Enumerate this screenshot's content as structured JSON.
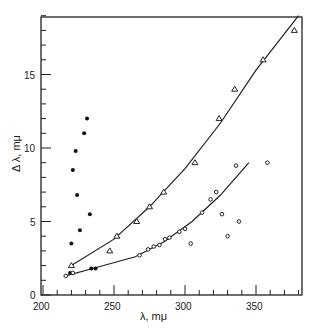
{
  "chart_data": {
    "type": "scatter",
    "title": "",
    "xlabel": "λ, mμ",
    "ylabel": "Δ λ, mμ",
    "xlim": [
      200,
      382
    ],
    "ylim": [
      0,
      19.5
    ],
    "xticks": [
      "200",
      "250",
      "300",
      "350"
    ],
    "yticks": [
      "0",
      "5",
      "10",
      "15"
    ],
    "grid": false,
    "series": [
      {
        "name": "filled-dots",
        "marker": "filled-circle",
        "x": [
          219,
          220,
          221,
          223,
          224,
          226,
          229,
          231,
          233,
          234,
          237
        ],
        "y": [
          1.5,
          3.5,
          8.5,
          9.8,
          6.8,
          4.4,
          11.0,
          12.0,
          5.5,
          1.8,
          1.8
        ]
      },
      {
        "name": "triangles",
        "marker": "triangle",
        "x": [
          220,
          247,
          252,
          266,
          275,
          285,
          307,
          324,
          335,
          355,
          377
        ],
        "y": [
          2.0,
          3.0,
          4.0,
          5.0,
          6.0,
          7.0,
          9.0,
          12.0,
          14.0,
          16.0,
          18.0
        ]
      },
      {
        "name": "open-circles",
        "marker": "open-circle",
        "x": [
          216,
          221,
          268,
          274,
          278,
          282,
          286,
          289,
          296,
          300,
          304,
          312,
          318,
          322,
          326,
          330,
          336,
          338,
          358
        ],
        "y": [
          1.3,
          1.5,
          2.7,
          3.1,
          3.3,
          3.4,
          3.8,
          3.9,
          4.3,
          4.5,
          3.5,
          5.6,
          6.5,
          7.0,
          5.5,
          4.0,
          8.8,
          5.0,
          9.0
        ]
      }
    ],
    "curves": [
      {
        "name": "upper-fit",
        "x": [
          220,
          250,
          275,
          300,
          325,
          350,
          380
        ],
        "y": [
          2.0,
          3.8,
          6.0,
          8.6,
          11.7,
          15.3,
          19.0
        ]
      },
      {
        "name": "lower-fit",
        "x": [
          216,
          235,
          265,
          285,
          305,
          325,
          345
        ],
        "y": [
          1.3,
          1.8,
          2.6,
          3.6,
          5.0,
          6.8,
          9.0
        ]
      }
    ]
  }
}
